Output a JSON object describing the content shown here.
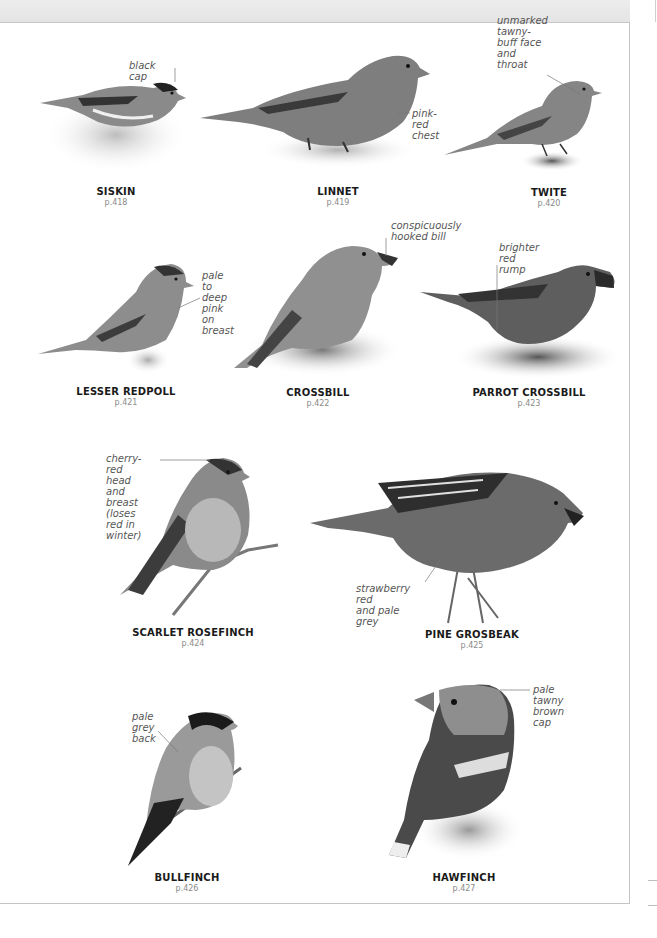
{
  "page": {
    "background": "#ffffff",
    "header_band_color": "#e8e8e8",
    "border_color": "#c4c4c4"
  },
  "birds": [
    {
      "id": "siskin",
      "name": "SISKIN",
      "page": "p.418",
      "note": "black cap"
    },
    {
      "id": "linnet",
      "name": "LINNET",
      "page": "p.419",
      "note": "pink-red\nchest"
    },
    {
      "id": "twite",
      "name": "TWITE",
      "page": "p.420",
      "note": "unmarked\ntawny-buff face\nand throat"
    },
    {
      "id": "lesser-redpoll",
      "name": "LESSER REDPOLL",
      "page": "p.421",
      "note": "pale to\ndeep pink\non breast"
    },
    {
      "id": "crossbill",
      "name": "CROSSBILL",
      "page": "p.422",
      "note": "conspicuously\nhooked bill"
    },
    {
      "id": "parrot-crossbill",
      "name": "PARROT CROSSBILL",
      "page": "p.423",
      "note": "brighter red\nrump"
    },
    {
      "id": "scarlet-rosefinch",
      "name": "SCARLET ROSEFINCH",
      "page": "p.424",
      "note": "cherry-red\nhead and\nbreast (loses\nred in winter)"
    },
    {
      "id": "pine-grosbeak",
      "name": "PINE GROSBEAK",
      "page": "p.425",
      "note": "strawberry red\nand pale grey"
    },
    {
      "id": "bullfinch",
      "name": "BULLFINCH",
      "page": "p.426",
      "note": "pale grey\nback"
    },
    {
      "id": "hawfinch",
      "name": "HAWFINCH",
      "page": "p.427",
      "note": "pale tawny\nbrown cap"
    }
  ]
}
